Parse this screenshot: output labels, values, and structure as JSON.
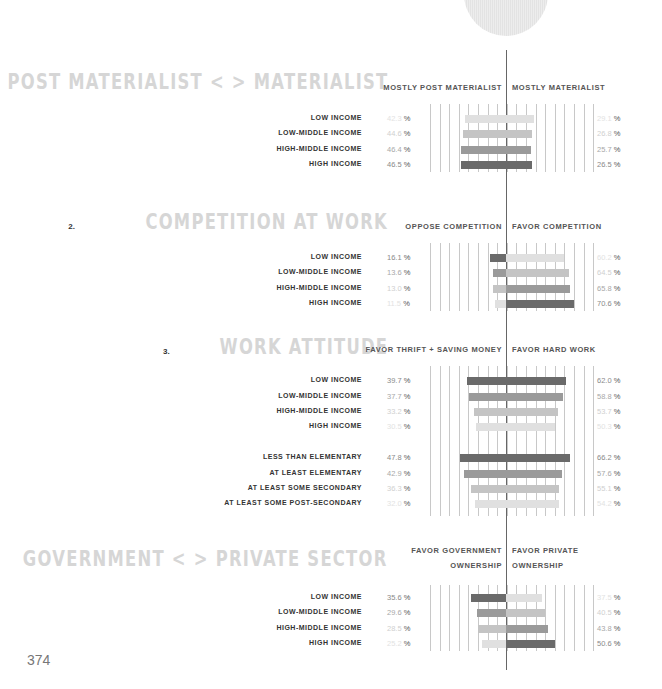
{
  "page_number": "374",
  "scale_px_per_pct": 0.97,
  "center_x": 506,
  "shades": {
    "1": "#e0e0e0",
    "2": "#c4c4c4",
    "3": "#9a9a9a",
    "4": "#6a6a6a"
  },
  "text_shades": {
    "1": "#e2e2e2",
    "2": "#cfcfcf",
    "3": "#a8a8a8",
    "4": "#8a8a8a"
  },
  "sections": [
    {
      "number": "1.",
      "title": "POST MATERIALIST < > MATERIALIST",
      "title_y": 70,
      "left_header": [
        "MOSTLY POST MATERIALIST"
      ],
      "right_header": [
        "MOSTLY MATERIALIST"
      ],
      "header_y": 80,
      "grid_top": 104,
      "grid_bottom": 172
    },
    {
      "number": "2.",
      "title": "COMPETITION AT WORK",
      "title_y": 210,
      "left_header": [
        "OPPOSE COMPETITION"
      ],
      "right_header": [
        "FAVOR COMPETITION"
      ],
      "header_y": 219,
      "grid_top": 243,
      "grid_bottom": 311
    },
    {
      "number": "3.",
      "title": "WORK ATTITUDE",
      "title_y": 335,
      "left_header": [
        "FAVOR THRIFT + SAVING MONEY"
      ],
      "right_header": [
        "FAVOR HARD WORK"
      ],
      "header_y": 342,
      "grid_top": 366,
      "grid_bottom": 516
    },
    {
      "number": "4.",
      "title": "GOVERNMENT < > PRIVATE SECTOR",
      "title_y": 547,
      "left_header": [
        "FAVOR GOVERNMENT",
        "OWNERSHIP"
      ],
      "right_header": [
        "FAVOR PRIVATE",
        "OWNERSHIP"
      ],
      "header_y": 543,
      "grid_top": 585,
      "grid_bottom": 651
    }
  ],
  "chart_data": {
    "type": "bar",
    "subtype": "diverging horizontal bar",
    "unit": "%",
    "charts": [
      {
        "title": "1. POST MATERIALIST < > MATERIALIST",
        "left_series": "MOSTLY POST MATERIALIST",
        "right_series": "MOSTLY MATERIALIST",
        "categories": [
          "LOW INCOME",
          "LOW-MIDDLE INCOME",
          "HIGH-MIDDLE INCOME",
          "HIGH INCOME"
        ],
        "left_values": [
          42.3,
          44.6,
          46.4,
          46.5
        ],
        "right_values": [
          29.1,
          26.8,
          25.7,
          26.5
        ]
      },
      {
        "title": "2. COMPETITION AT WORK",
        "left_series": "OPPOSE COMPETITION",
        "right_series": "FAVOR COMPETITION",
        "categories": [
          "LOW INCOME",
          "LOW-MIDDLE INCOME",
          "HIGH-MIDDLE INCOME",
          "HIGH INCOME"
        ],
        "left_values": [
          16.1,
          13.6,
          13.0,
          11.5
        ],
        "right_values": [
          60.2,
          64.5,
          65.8,
          70.6
        ]
      },
      {
        "title": "3. WORK ATTITUDE",
        "left_series": "FAVOR THRIFT + SAVING MONEY",
        "right_series": "FAVOR HARD WORK",
        "categories": [
          "LOW INCOME",
          "LOW-MIDDLE INCOME",
          "HIGH-MIDDLE INCOME",
          "HIGH INCOME",
          "LESS THAN ELEMENTARY",
          "AT LEAST ELEMENTARY",
          "AT LEAST SOME SECONDARY",
          "AT LEAST SOME POST-SECONDARY"
        ],
        "left_values": [
          39.7,
          37.7,
          33.2,
          30.5,
          47.8,
          42.9,
          36.3,
          32.0
        ],
        "right_values": [
          62.0,
          58.8,
          53.7,
          50.3,
          66.2,
          57.6,
          55.1,
          54.2
        ]
      },
      {
        "title": "4. GOVERNMENT < > PRIVATE SECTOR",
        "left_series": "FAVOR GOVERNMENT OWNERSHIP",
        "right_series": "FAVOR PRIVATE OWNERSHIP",
        "categories": [
          "LOW INCOME",
          "LOW-MIDDLE INCOME",
          "HIGH-MIDDLE INCOME",
          "HIGH INCOME"
        ],
        "left_values": [
          35.6,
          29.6,
          28.5,
          25.2
        ],
        "right_values": [
          37.5,
          40.5,
          43.8,
          50.6
        ]
      }
    ]
  },
  "rows": [
    {
      "section": 0,
      "y": 112,
      "label": "LOW INCOME",
      "left": "42.3",
      "right": "29.1",
      "lshade": 1,
      "rshade": 1,
      "lval": 42.3,
      "rval": 29.1
    },
    {
      "section": 0,
      "y": 127,
      "label": "LOW-MIDDLE INCOME",
      "left": "44.6",
      "right": "26.8",
      "lshade": 2,
      "rshade": 2,
      "lval": 44.6,
      "rval": 26.8
    },
    {
      "section": 0,
      "y": 143,
      "label": "HIGH-MIDDLE INCOME",
      "left": "46.4",
      "right": "25.7",
      "lshade": 3,
      "rshade": 3,
      "lval": 46.4,
      "rval": 25.7
    },
    {
      "section": 0,
      "y": 158,
      "label": "HIGH INCOME",
      "left": "46.5",
      "right": "26.5",
      "lshade": 4,
      "rshade": 4,
      "lval": 46.5,
      "rval": 26.5
    },
    {
      "section": 1,
      "y": 251,
      "label": "LOW INCOME",
      "left": "16.1",
      "right": "60.2",
      "lshade": 4,
      "rshade": 1,
      "lval": 16.1,
      "rval": 60.2
    },
    {
      "section": 1,
      "y": 266,
      "label": "LOW-MIDDLE INCOME",
      "left": "13.6",
      "right": "64.5",
      "lshade": 3,
      "rshade": 2,
      "lval": 13.6,
      "rval": 64.5
    },
    {
      "section": 1,
      "y": 282,
      "label": "HIGH-MIDDLE INCOME",
      "left": "13.0",
      "right": "65.8",
      "lshade": 2,
      "rshade": 3,
      "lval": 13.0,
      "rval": 65.8
    },
    {
      "section": 1,
      "y": 297,
      "label": "HIGH INCOME",
      "left": "11.5",
      "right": "70.6",
      "lshade": 1,
      "rshade": 4,
      "lval": 11.5,
      "rval": 70.6
    },
    {
      "section": 2,
      "y": 374,
      "label": "LOW INCOME",
      "left": "39.7",
      "right": "62.0",
      "lshade": 4,
      "rshade": 4,
      "lval": 39.7,
      "rval": 62.0
    },
    {
      "section": 2,
      "y": 390,
      "label": "LOW-MIDDLE INCOME",
      "left": "37.7",
      "right": "58.8",
      "lshade": 3,
      "rshade": 3,
      "lval": 37.7,
      "rval": 58.8
    },
    {
      "section": 2,
      "y": 405,
      "label": "HIGH-MIDDLE INCOME",
      "left": "33.2",
      "right": "53.7",
      "lshade": 2,
      "rshade": 2,
      "lval": 33.2,
      "rval": 53.7
    },
    {
      "section": 2,
      "y": 420,
      "label": "HIGH INCOME",
      "left": "30.5",
      "right": "50.3",
      "lshade": 1,
      "rshade": 1,
      "lval": 30.5,
      "rval": 50.3
    },
    {
      "section": 2,
      "y": 451,
      "label": "LESS THAN ELEMENTARY",
      "left": "47.8",
      "right": "66.2",
      "lshade": 4,
      "rshade": 4,
      "lval": 47.8,
      "rval": 66.2
    },
    {
      "section": 2,
      "y": 467,
      "label": "AT LEAST ELEMENTARY",
      "left": "42.9",
      "right": "57.6",
      "lshade": 3,
      "rshade": 3,
      "lval": 42.9,
      "rval": 57.6
    },
    {
      "section": 2,
      "y": 482,
      "label": "AT LEAST SOME SECONDARY",
      "left": "36.3",
      "right": "55.1",
      "lshade": 2,
      "rshade": 2,
      "lval": 36.3,
      "rval": 55.1
    },
    {
      "section": 2,
      "y": 497,
      "label": "AT LEAST SOME POST-SECONDARY",
      "left": "32.0",
      "right": "54.2",
      "lshade": 1,
      "rshade": 1,
      "lval": 32.0,
      "rval": 54.2
    },
    {
      "section": 3,
      "y": 591,
      "label": "LOW INCOME",
      "left": "35.6",
      "right": "37.5",
      "lshade": 4,
      "rshade": 1,
      "lval": 35.6,
      "rval": 37.5
    },
    {
      "section": 3,
      "y": 606,
      "label": "LOW-MIDDLE INCOME",
      "left": "29.6",
      "right": "40.5",
      "lshade": 3,
      "rshade": 2,
      "lval": 29.6,
      "rval": 40.5
    },
    {
      "section": 3,
      "y": 622,
      "label": "HIGH-MIDDLE INCOME",
      "left": "28.5",
      "right": "43.8",
      "lshade": 2,
      "rshade": 3,
      "lval": 28.5,
      "rval": 43.8
    },
    {
      "section": 3,
      "y": 637,
      "label": "HIGH INCOME",
      "left": "25.2",
      "right": "50.6",
      "lshade": 1,
      "rshade": 4,
      "lval": 25.2,
      "rval": 50.6
    }
  ],
  "percent_sign": "%"
}
